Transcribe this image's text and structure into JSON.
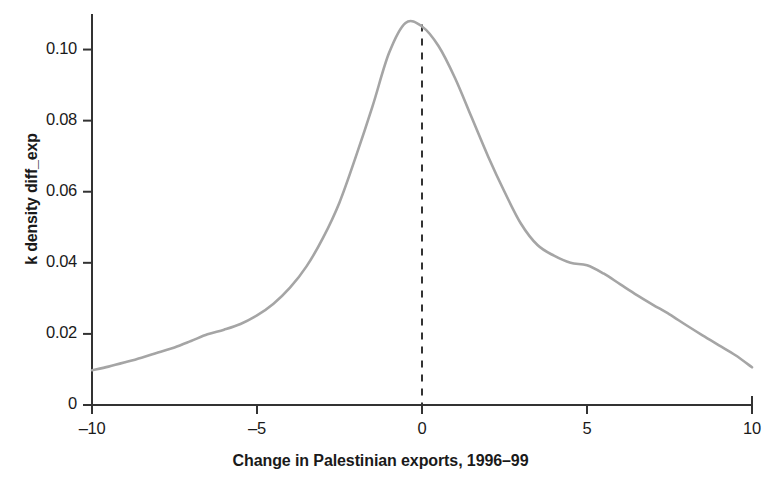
{
  "chart_data": {
    "type": "line",
    "title": "",
    "subtitle": "",
    "xlabel": "Change in Palestinian exports, 1996–99",
    "ylabel": "k density diff_exp",
    "xlim": [
      -10,
      10
    ],
    "ylim": [
      0,
      0.11
    ],
    "grid": false,
    "legend": null,
    "xticks": [
      -10,
      -5,
      0,
      5,
      10
    ],
    "xtick_labels": [
      "–10",
      "–5",
      "0",
      "5",
      "10"
    ],
    "yticks": [
      0,
      0.02,
      0.04,
      0.06,
      0.08,
      0.1
    ],
    "ytick_labels": [
      "0",
      "0.02",
      "0.04",
      "0.06",
      "0.08",
      "0.10"
    ],
    "annotations": [
      {
        "name": "zero-reference-line",
        "type": "vline",
        "x": 0,
        "style": "dashed",
        "color": "#333333"
      }
    ],
    "series": [
      {
        "name": "k density diff_exp",
        "color": "#a5a5a5",
        "x": [
          -10.0,
          -9.5,
          -9.0,
          -8.5,
          -8.0,
          -7.5,
          -7.0,
          -6.5,
          -6.0,
          -5.5,
          -5.0,
          -4.5,
          -4.0,
          -3.5,
          -3.0,
          -2.5,
          -2.0,
          -1.5,
          -1.0,
          -0.5,
          0.0,
          0.5,
          1.0,
          1.5,
          2.0,
          2.5,
          3.0,
          3.5,
          4.0,
          4.5,
          5.0,
          5.5,
          6.0,
          6.5,
          7.0,
          7.5,
          8.0,
          8.5,
          9.0,
          9.5,
          10.0
        ],
        "y": [
          0.0098,
          0.0108,
          0.012,
          0.0133,
          0.0148,
          0.0162,
          0.018,
          0.0199,
          0.0212,
          0.0228,
          0.0252,
          0.0285,
          0.033,
          0.039,
          0.047,
          0.057,
          0.07,
          0.084,
          0.099,
          0.1075,
          0.1065,
          0.101,
          0.092,
          0.081,
          0.07,
          0.06,
          0.051,
          0.045,
          0.042,
          0.04,
          0.0393,
          0.037,
          0.034,
          0.031,
          0.0282,
          0.0255,
          0.0225,
          0.0196,
          0.0168,
          0.014,
          0.0106
        ]
      }
    ]
  },
  "axes": {
    "y_axis_name": "y-axis",
    "x_axis_name": "x-axis"
  }
}
